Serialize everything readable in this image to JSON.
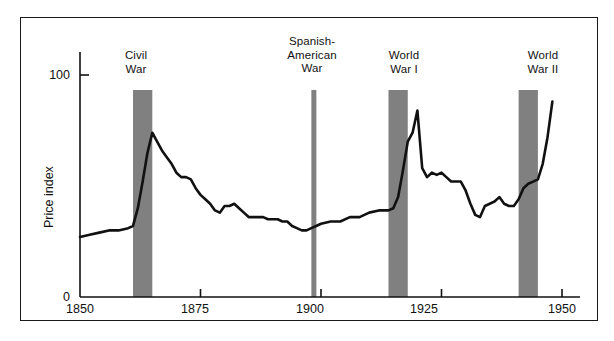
{
  "figure": {
    "background_color": "#ffffff",
    "frame_color": "#1a1a1a",
    "line_color": "#111111",
    "band_color": "#808080"
  },
  "chart_data": {
    "type": "line",
    "title": "",
    "subtitle": "",
    "xlabel": "",
    "ylabel": "Price index",
    "xlim": [
      1850,
      1950
    ],
    "ylim": [
      0,
      100
    ],
    "grid": false,
    "legend": "none",
    "x_ticks": [
      1850,
      1875,
      1900,
      1925,
      1950
    ],
    "x_tick_labels": [
      "1850",
      "1875",
      "1900",
      "1925",
      "1950"
    ],
    "y_ticks": [
      0,
      100
    ],
    "y_tick_labels": [
      "0",
      "100"
    ],
    "series": [
      {
        "name": "Price index",
        "x": [
          1850,
          1852,
          1854,
          1856,
          1858,
          1860,
          1861,
          1862,
          1863,
          1864,
          1865,
          1866,
          1867,
          1868,
          1869,
          1870,
          1871,
          1872,
          1873,
          1874,
          1875,
          1876,
          1877,
          1878,
          1879,
          1880,
          1881,
          1882,
          1883,
          1884,
          1885,
          1886,
          1887,
          1888,
          1889,
          1890,
          1891,
          1892,
          1893,
          1894,
          1895,
          1896,
          1897,
          1898,
          1899,
          1900,
          1902,
          1904,
          1906,
          1908,
          1910,
          1912,
          1914,
          1915,
          1916,
          1917,
          1918,
          1919,
          1920,
          1921,
          1922,
          1923,
          1924,
          1925,
          1926,
          1927,
          1928,
          1929,
          1930,
          1931,
          1932,
          1933,
          1934,
          1935,
          1936,
          1937,
          1938,
          1939,
          1940,
          1941,
          1942,
          1943,
          1944,
          1945,
          1946,
          1947,
          1948
        ],
        "values": [
          27,
          28,
          29,
          30,
          30,
          31,
          32,
          40,
          52,
          65,
          74,
          70,
          66,
          63,
          60,
          56,
          54,
          54,
          53,
          49,
          46,
          44,
          42,
          39,
          38,
          41,
          41,
          42,
          40,
          38,
          36,
          36,
          36,
          36,
          35,
          35,
          35,
          34,
          34,
          32,
          31,
          30,
          30,
          31,
          32,
          33,
          34,
          34,
          36,
          36,
          38,
          39,
          39,
          40,
          45,
          57,
          70,
          74,
          84,
          58,
          54,
          56,
          55,
          56,
          54,
          52,
          52,
          52,
          48,
          42,
          37,
          36,
          41,
          42,
          43,
          45,
          42,
          41,
          41,
          44,
          49,
          51,
          52,
          53,
          60,
          72,
          88
        ]
      }
    ],
    "shaded_regions": [
      {
        "name": "civil-war",
        "label": "Civil\nWar",
        "start": 1861,
        "end": 1865,
        "color": "#808080"
      },
      {
        "name": "spanish-american-war",
        "label": "Spanish-\nAmerican\nWar",
        "start": 1898,
        "end": 1899,
        "color": "#808080"
      },
      {
        "name": "world-war-i",
        "label": "World\nWar I",
        "start": 1914,
        "end": 1918,
        "color": "#808080"
      },
      {
        "name": "world-war-ii",
        "label": "World\nWar II",
        "start": 1941,
        "end": 1945,
        "color": "#808080"
      }
    ]
  },
  "labels": {
    "y_axis_title": "Price index",
    "y_tick_100": "100",
    "y_tick_0": "0",
    "x_tick_1850": "1850",
    "x_tick_1875": "1875",
    "x_tick_1900": "1900",
    "x_tick_1925": "1925",
    "x_tick_1950": "1950",
    "band_civil_war": "Civil\nWar",
    "band_spanish_american_war": "Spanish-\nAmerican\nWar",
    "band_world_war_i": "World\nWar I",
    "band_world_war_ii": "World\nWar II"
  }
}
